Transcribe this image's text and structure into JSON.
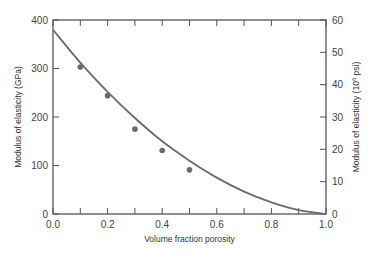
{
  "chart_data": {
    "type": "scatter",
    "title": "",
    "xlabel": "Volume fraction porosity",
    "ylabel": "Modulus of elasticity (GPa)",
    "ylabel_right": "Modulus of elasticity (10^6 psi)",
    "ylabel_right_parts": {
      "pre": "Modulus of elasticity (10",
      "sup": "6",
      "post": " psi)"
    },
    "xlim": [
      0.0,
      1.0
    ],
    "ylim": [
      0,
      400
    ],
    "ylim_right": [
      0,
      60
    ],
    "x_ticks": [
      "0.0",
      "0.2",
      "0.4",
      "0.6",
      "0.8",
      "1.0"
    ],
    "x_minor_ticks": [
      0.1,
      0.3,
      0.5,
      0.7,
      0.9
    ],
    "y_ticks": [
      "0",
      "100",
      "200",
      "300",
      "400"
    ],
    "y_ticks_right": [
      "0",
      "10",
      "20",
      "30",
      "40",
      "50",
      "60"
    ],
    "grid": false,
    "legend": null,
    "series": [
      {
        "name": "Measured data",
        "kind": "points",
        "x": [
          0.1,
          0.2,
          0.3,
          0.4,
          0.5
        ],
        "y": [
          303,
          244,
          175,
          131,
          91
        ]
      },
      {
        "name": "Fitted curve",
        "kind": "line",
        "x": [
          0.0,
          0.1,
          0.2,
          0.3,
          0.4,
          0.5,
          0.6,
          0.7,
          0.8,
          0.9,
          1.0
        ],
        "y": [
          380,
          312,
          252,
          198,
          150,
          110,
          75,
          46,
          24,
          8,
          0
        ]
      }
    ],
    "colors": {
      "axes": "#555555",
      "series": "#6b6b6b"
    }
  }
}
